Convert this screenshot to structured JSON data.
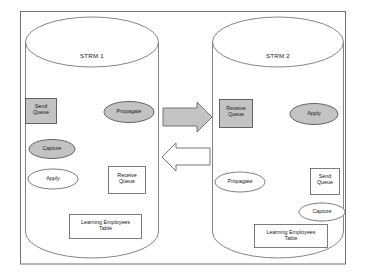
{
  "diagram": {
    "frame": {
      "name": "outer-frame"
    },
    "colors": {
      "fill_highlight": "#c3c3c3",
      "fill_plain": "#ffffff",
      "stroke": "#6e6e6e",
      "stroke_dark": "#4a4a4a",
      "text": "#1a1a1a"
    },
    "databases": [
      {
        "id": "strm1",
        "title": "STRM 1",
        "nodes": [
          {
            "id": "strm1-send-queue",
            "label": "Send\nQueue",
            "shape": "rect",
            "state": "highlighted"
          },
          {
            "id": "strm1-propagate",
            "label": "Propagate",
            "shape": "ellipse",
            "state": "highlighted"
          },
          {
            "id": "strm1-capture",
            "label": "Capture",
            "shape": "ellipse",
            "state": "highlighted"
          },
          {
            "id": "strm1-apply",
            "label": "Apply",
            "shape": "ellipse",
            "state": "plain"
          },
          {
            "id": "strm1-receive-queue",
            "label": "Receive\nQueue",
            "shape": "rect",
            "state": "plain"
          },
          {
            "id": "strm1-table",
            "label": "Learning Employees\nTable",
            "shape": "rect",
            "state": "plain"
          }
        ]
      },
      {
        "id": "strm2",
        "title": "STRM 2",
        "nodes": [
          {
            "id": "strm2-receive-queue",
            "label": "Receive\nQueue",
            "shape": "rect",
            "state": "highlighted"
          },
          {
            "id": "strm2-apply",
            "label": "Apply",
            "shape": "ellipse",
            "state": "highlighted"
          },
          {
            "id": "strm2-propagate",
            "label": "Propagate",
            "shape": "ellipse",
            "state": "plain"
          },
          {
            "id": "strm2-send-queue",
            "label": "Send\nQueue",
            "shape": "rect",
            "state": "plain"
          },
          {
            "id": "strm2-capture",
            "label": "Capture",
            "shape": "ellipse",
            "state": "plain"
          },
          {
            "id": "strm2-table",
            "label": "Learning Employees\nTable",
            "shape": "rect",
            "state": "plain"
          }
        ]
      }
    ],
    "arrows": [
      {
        "id": "arrow-left-to-right",
        "direction": "right",
        "state": "highlighted"
      },
      {
        "id": "arrow-right-to-left",
        "direction": "left",
        "state": "plain"
      }
    ]
  }
}
